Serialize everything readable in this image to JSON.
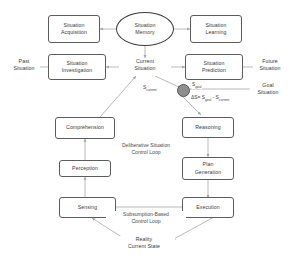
{
  "diagram": {
    "nodes": {
      "situation_acquisition": "Situation\nAcquisition",
      "situation_memory": "Situation\nMemory",
      "situation_learning": "Situation\nLearning",
      "situation_investigation": "Situation\nInvestigation",
      "current_situation": "Current\nSituation",
      "situation_prediction": "Situation\nPrediction",
      "comprehension": "Comprehension",
      "reasoning": "Reasoning",
      "perception": "Perception",
      "plan_generation": "Plan\nGeneration",
      "sensing": "Sensing",
      "execution": "Execution"
    },
    "free_text": {
      "past_situation": "Past\nSituation",
      "future_situation": "Future\nSituation",
      "goal_situation": "Goal\nSituation",
      "reality_current_state": "Reality\nCurrent State"
    },
    "loop_labels": {
      "deliberative": "Deliberative Situation\nControl Loop",
      "subsumption": "Subsumption-Based\nControl Loop"
    },
    "math": {
      "s_current_label": "S",
      "s_current_sub": "current",
      "s_goal_label": "S",
      "s_goal_sub": "goal",
      "delta_prefix": "ΔS= S",
      "delta_sub1": "goal",
      "delta_mid": " - S",
      "delta_sub2": "current"
    },
    "colors": {
      "node_border": "#5c5c5c",
      "ellipse_border": "#3d3d3d",
      "text": "#3a3a3a",
      "wire": "#a8a8a8",
      "dot_fill": "#8e8e8e",
      "background": "#ffffff"
    }
  }
}
